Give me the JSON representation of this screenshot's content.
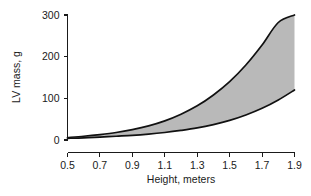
{
  "chart_data": {
    "type": "area",
    "title": "",
    "subtitle": "",
    "xlabel": "Height, meters",
    "ylabel": "LV mass, g",
    "xlim": [
      0.5,
      1.9
    ],
    "ylim": [
      0,
      300
    ],
    "xticks": [
      "0.5",
      "0.7",
      "0.9",
      "1.1",
      "1.3",
      "1.5",
      "1.7",
      "1.9"
    ],
    "xtick_values": [
      0.5,
      0.7,
      0.9,
      1.1,
      1.3,
      1.5,
      1.7,
      1.9
    ],
    "yticks": [
      "0",
      "100",
      "200",
      "300"
    ],
    "ytick_values": [
      0,
      100,
      200,
      300
    ],
    "grid": false,
    "legend": "none",
    "annotations": [],
    "fill_color": "#b9b9b9",
    "line_color": "#111111",
    "background_color": "#ffffff",
    "x": [
      0.5,
      0.6,
      0.7,
      0.8,
      0.9,
      1.0,
      1.1,
      1.2,
      1.3,
      1.4,
      1.5,
      1.6,
      1.7,
      1.8,
      1.9
    ],
    "series": [
      {
        "name": "Upper limit of LV mass",
        "values": [
          6,
          9,
          13,
          18,
          25,
          34,
          46,
          62,
          82,
          108,
          140,
          180,
          228,
          282,
          300
        ]
      },
      {
        "name": "Lower limit of LV mass",
        "values": [
          4,
          5,
          7,
          9,
          11,
          14,
          18,
          23,
          29,
          37,
          47,
          60,
          76,
          96,
          120
        ]
      }
    ]
  },
  "axes": {
    "y_axis_name": "y-axis",
    "x_axis_name": "x-axis"
  }
}
